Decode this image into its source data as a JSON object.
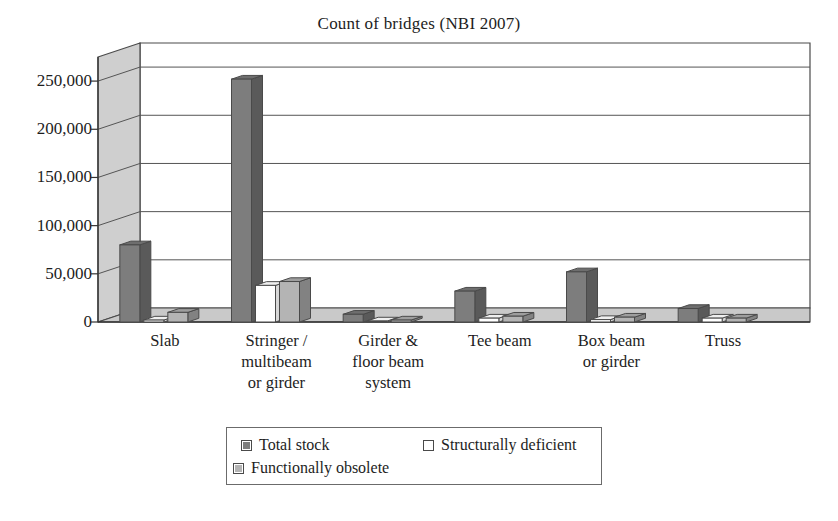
{
  "chart_data": {
    "type": "bar",
    "title": "Count of bridges (NBI 2007)",
    "xlabel": "",
    "ylabel": "",
    "ylim": [
      0,
      275000
    ],
    "grid": true,
    "legend_position": "bottom",
    "style": "3d-clustered-column",
    "categories": [
      "Slab",
      "Stringer /\nmultibeam\nor girder",
      "Girder &\nfloor beam\nsystem",
      "Tee beam",
      "Box beam\nor girder",
      "Truss"
    ],
    "yticks": [
      0,
      50000,
      100000,
      150000,
      200000,
      250000
    ],
    "ytick_labels": [
      "0",
      "50,000",
      "100,000",
      "150,000",
      "200,000",
      "250,000"
    ],
    "series": [
      {
        "name": "Total stock",
        "color": "#7d7d7d",
        "values": [
          80000,
          252000,
          8000,
          32000,
          52000,
          14000
        ]
      },
      {
        "name": "Structurally deficient",
        "color": "#ffffff",
        "values": [
          2000,
          38000,
          1000,
          4000,
          2500,
          4000
        ]
      },
      {
        "name": "Functionally obsolete",
        "color": "#b4b4b4",
        "values": [
          10000,
          42000,
          2000,
          6000,
          5000,
          4000
        ]
      }
    ]
  },
  "title": "Count of bridges (NBI 2007)",
  "axis": {
    "y_tick_labels": [
      "250,000",
      "200,000",
      "150,000",
      "100,000",
      "50,000",
      "0"
    ]
  },
  "categories": [
    {
      "lines": [
        "Slab"
      ]
    },
    {
      "lines": [
        "Stringer /",
        "multibeam",
        "or girder"
      ]
    },
    {
      "lines": [
        "Girder &",
        "floor beam",
        "system"
      ]
    },
    {
      "lines": [
        "Tee beam"
      ]
    },
    {
      "lines": [
        "Box beam",
        "or girder"
      ]
    },
    {
      "lines": [
        "Truss"
      ]
    }
  ],
  "legend": {
    "items": [
      {
        "label": "Total stock",
        "swatch": "total"
      },
      {
        "label": "Structurally deficient",
        "swatch": "deficient"
      },
      {
        "label": "Functionally obsolete",
        "swatch": "obsolete"
      }
    ]
  },
  "colors": {
    "total_stock": "#7d7d7d",
    "structurally_deficient": "#ffffff",
    "functionally_obsolete": "#b4b4b4",
    "wall": "#cfcfcf",
    "floor": "#c9c9c9",
    "outline": "#4a4a4a",
    "text": "#1d1d1d"
  }
}
